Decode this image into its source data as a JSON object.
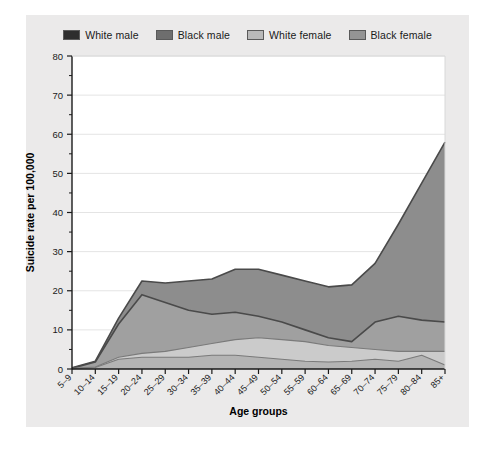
{
  "chart_data": {
    "type": "area",
    "title": "",
    "xlabel": "Age groups",
    "ylabel": "Suicide rate per 100,000",
    "ylim": [
      0,
      80
    ],
    "yticks": [
      0,
      10,
      20,
      30,
      40,
      50,
      60,
      70,
      80
    ],
    "yticklabels": [
      "0",
      "10",
      "20",
      "30",
      "40",
      "50",
      "60",
      "70",
      "80"
    ],
    "minor_yticks": [
      5,
      15,
      25,
      35,
      45,
      55,
      65,
      75
    ],
    "grid": "horizontal",
    "legend_position": "top-center",
    "categories": [
      "5–9",
      "10–14",
      "15–19",
      "20–24",
      "25–29",
      "30–34",
      "35–39",
      "40–44",
      "45–49",
      "50–54",
      "55–59",
      "60–64",
      "65–69",
      "70–74",
      "75–79",
      "80–84",
      "85+"
    ],
    "series": [
      {
        "name": "White male",
        "color": "#8d8d8d",
        "line_color": "#4a4a4a",
        "values": [
          0.3,
          2.0,
          13.0,
          22.5,
          22.0,
          22.5,
          23.0,
          25.5,
          25.5,
          24.0,
          22.5,
          21.0,
          21.5,
          27.0,
          37.0,
          47.5,
          58.0
        ]
      },
      {
        "name": "Black male",
        "color": "#a0a0a0",
        "line_color": "#4a4a4a",
        "values": [
          0.2,
          1.8,
          11.5,
          19.0,
          17.0,
          15.0,
          14.0,
          14.5,
          13.5,
          12.0,
          10.0,
          8.0,
          7.0,
          12.0,
          13.5,
          12.5,
          12.0
        ]
      },
      {
        "name": "White female",
        "color": "#cbcbcb",
        "line_color": "#7a7a7a",
        "values": [
          0.1,
          0.5,
          3.0,
          4.0,
          4.5,
          5.5,
          6.5,
          7.5,
          8.0,
          7.5,
          7.0,
          6.0,
          5.5,
          5.0,
          4.5,
          4.5,
          4.5
        ]
      },
      {
        "name": "Black female",
        "color": "#b4b4b4",
        "line_color": "#7a7a7a",
        "values": [
          0.1,
          0.4,
          2.5,
          3.0,
          3.0,
          3.0,
          3.5,
          3.5,
          3.0,
          2.5,
          2.0,
          1.8,
          2.0,
          2.5,
          2.0,
          3.5,
          1.0
        ]
      }
    ]
  },
  "legend": {
    "items": [
      {
        "label": "White male",
        "color": "#2e2e2e"
      },
      {
        "label": "Black male",
        "color": "#6e6e6e"
      },
      {
        "label": "White female",
        "color": "#b9b9b9"
      },
      {
        "label": "Black female",
        "color": "#949494"
      }
    ]
  },
  "colors": {
    "card_background": "#ebeaea",
    "plot_background": "#ffffff",
    "axis": "#1a1a1a",
    "grid": "#e4e4e4"
  }
}
